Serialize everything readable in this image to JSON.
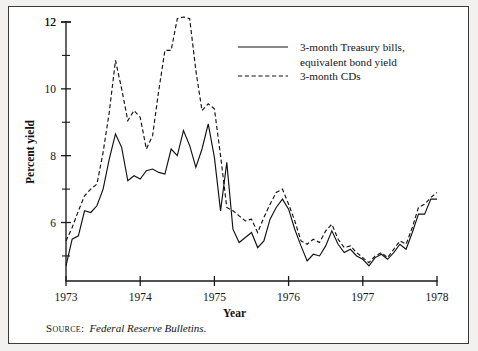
{
  "figure": {
    "background_color": "#f2f1ef",
    "panel_color": "#ffffff",
    "border_color": "#3a3a38",
    "ink_color": "#111111"
  },
  "source_note": {
    "label": "Source:",
    "title": "Federal Reserve Bulletins."
  },
  "chart_data": {
    "type": "line",
    "title": "",
    "xlabel": "Year",
    "ylabel": "Percent yield",
    "xlim": [
      1973.0,
      1978.0
    ],
    "ylim": [
      4.25,
      12.2
    ],
    "grid": false,
    "legend_position": "top-right",
    "y_ticks_major": [
      6,
      8,
      10,
      12
    ],
    "y_ticks_minor": [
      5,
      7,
      9,
      11
    ],
    "y_tick_labels": [
      "6",
      "8",
      "10",
      "12"
    ],
    "x_ticks": [
      1973,
      1974,
      1975,
      1976,
      1977,
      1978
    ],
    "x_tick_labels": [
      "1973",
      "1974",
      "1975",
      "1976",
      "1977",
      "1978"
    ],
    "series": [
      {
        "name": "3-month Treasury bills, equivalent bond yield",
        "style": "solid",
        "legend_label_line1": "3-month Treasury bills,",
        "legend_label_line2": "equivalent bond yield",
        "x": [
          1973.0,
          1973.083,
          1973.167,
          1973.25,
          1973.333,
          1973.417,
          1973.5,
          1973.583,
          1973.667,
          1973.75,
          1973.833,
          1973.917,
          1974.0,
          1974.083,
          1974.167,
          1974.25,
          1974.333,
          1974.417,
          1974.5,
          1974.583,
          1974.667,
          1974.75,
          1974.833,
          1974.917,
          1975.0,
          1975.083,
          1975.167,
          1975.25,
          1975.333,
          1975.417,
          1975.5,
          1975.583,
          1975.667,
          1975.75,
          1975.833,
          1975.917,
          1976.0,
          1976.083,
          1976.167,
          1976.25,
          1976.333,
          1976.417,
          1976.5,
          1976.583,
          1976.667,
          1976.75,
          1976.833,
          1976.917,
          1977.0,
          1977.083,
          1977.167,
          1977.25,
          1977.333,
          1977.417,
          1977.5,
          1977.583,
          1977.667,
          1977.75,
          1977.833,
          1977.917,
          1978.0
        ],
        "y": [
          4.7,
          5.5,
          5.6,
          6.35,
          6.3,
          6.5,
          7.0,
          7.9,
          8.65,
          8.25,
          7.25,
          7.4,
          7.3,
          7.55,
          7.6,
          7.5,
          7.45,
          8.2,
          8.0,
          8.75,
          8.3,
          7.65,
          8.2,
          8.95,
          7.95,
          6.35,
          7.8,
          5.8,
          5.4,
          5.55,
          5.7,
          5.25,
          5.45,
          6.1,
          6.45,
          6.7,
          6.4,
          5.8,
          5.3,
          4.85,
          5.05,
          5.0,
          5.3,
          5.75,
          5.35,
          5.1,
          5.2,
          5.0,
          4.9,
          4.7,
          4.95,
          5.05,
          4.9,
          5.1,
          5.35,
          5.2,
          5.7,
          6.25,
          6.25,
          6.7,
          6.7
        ]
      },
      {
        "name": "3-month CDs",
        "style": "dashed",
        "legend_label": "3-month CDs",
        "x": [
          1973.0,
          1973.083,
          1973.167,
          1973.25,
          1973.333,
          1973.417,
          1973.5,
          1973.583,
          1973.667,
          1973.75,
          1973.833,
          1973.917,
          1974.0,
          1974.083,
          1974.167,
          1974.25,
          1974.333,
          1974.417,
          1974.5,
          1974.583,
          1974.667,
          1974.75,
          1974.833,
          1974.917,
          1975.0,
          1975.083,
          1975.167,
          1975.25,
          1975.333,
          1975.417,
          1975.5,
          1975.583,
          1975.667,
          1975.75,
          1975.833,
          1975.917,
          1976.0,
          1976.083,
          1976.167,
          1976.25,
          1976.333,
          1976.417,
          1976.5,
          1976.583,
          1976.667,
          1976.75,
          1976.833,
          1976.917,
          1977.0,
          1977.083,
          1977.167,
          1977.25,
          1977.333,
          1977.417,
          1977.5,
          1977.583,
          1977.667,
          1977.75,
          1977.833,
          1977.917,
          1978.0
        ],
        "y": [
          5.45,
          5.85,
          6.35,
          6.8,
          7.0,
          7.15,
          8.1,
          9.3,
          10.85,
          10.0,
          9.05,
          9.35,
          9.15,
          8.2,
          8.6,
          9.95,
          11.15,
          11.15,
          12.1,
          12.15,
          12.1,
          10.55,
          9.35,
          9.55,
          9.4,
          8.0,
          6.45,
          6.35,
          6.2,
          6.05,
          6.1,
          5.7,
          6.15,
          6.55,
          6.9,
          7.0,
          6.55,
          6.05,
          5.45,
          5.35,
          5.5,
          5.4,
          5.75,
          5.95,
          5.5,
          5.25,
          5.3,
          5.1,
          4.95,
          4.8,
          5.0,
          5.1,
          4.95,
          5.2,
          5.45,
          5.35,
          5.85,
          6.45,
          6.55,
          6.75,
          6.9
        ]
      }
    ]
  }
}
